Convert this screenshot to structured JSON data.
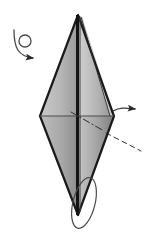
{
  "figure": {
    "kind": "origami-fold-diagram",
    "title": "Origami step diagram: narrow kite/diamond base with turn-over and fold indicators",
    "background_color": "#ffffff",
    "canvas": {
      "width": 148,
      "height": 234
    }
  },
  "palette": {
    "outline": "#1a1a1a",
    "crease_line": "#333333",
    "left_panel_light": "#c9c9c9",
    "left_panel_dark": "#9a9a9a",
    "right_panel_light": "#cfcfcf",
    "right_panel_dark": "#8f8f8f",
    "lower_left_light": "#b9b9b9",
    "lower_left_dark": "#8d8d8d",
    "lower_right_light": "#c4c4c4",
    "lower_right_dark": "#7e7e7e",
    "spine_dark": "#141414",
    "arrow_fill": "#2b2b2b",
    "loop_stroke": "#4a4a4a"
  },
  "shape": {
    "name": "diamond-body",
    "top_apex": {
      "x": 78,
      "y": 15
    },
    "left_vertex": {
      "x": 40,
      "y": 116
    },
    "right_vertex": {
      "x": 114,
      "y": 116
    },
    "bottom_apex": {
      "x": 78,
      "y": 215
    },
    "spine_x": 78,
    "midline_y": 116,
    "layer_offset_px": 5
  },
  "annotations": {
    "turn_over_symbol": {
      "name": "turn-over-loop-arrow",
      "description": "small circle with curving tail and solid arrowhead pointing down-right",
      "circle_center": {
        "x": 25,
        "y": 41
      },
      "circle_radius": 6,
      "arrow_tip": {
        "x": 39,
        "y": 61
      },
      "label": ""
    },
    "right_arrow": {
      "name": "fold-direction-arrow",
      "description": "straight horizontal arrow pointing right from the right vertex",
      "start": {
        "x": 113,
        "y": 110
      },
      "end": {
        "x": 145,
        "y": 110
      },
      "label": ""
    },
    "valley_fold_line": {
      "name": "dash-dot-fold-line",
      "description": "dash-dot crease running down-right from inside the body",
      "start": {
        "x": 77,
        "y": 116
      },
      "end": {
        "x": 100,
        "y": 130
      },
      "label": ""
    },
    "hidden_edge_line": {
      "name": "dashed-hidden-edge",
      "description": "dashed line continuing down-right outside the body",
      "start": {
        "x": 104,
        "y": 132
      },
      "end": {
        "x": 140,
        "y": 150
      },
      "label": ""
    },
    "bottom_loop": {
      "name": "bottom-rotation-loop",
      "description": "thin elongated ellipse loop at the bottom apex",
      "center": {
        "x": 84,
        "y": 203
      },
      "rx": 11,
      "ry": 26,
      "rotation_deg": 14,
      "label": ""
    },
    "midline": {
      "name": "horizontal-crease-midline",
      "start": {
        "x": 40,
        "y": 116
      },
      "end": {
        "x": 114,
        "y": 116
      },
      "label": ""
    }
  },
  "text_labels": []
}
